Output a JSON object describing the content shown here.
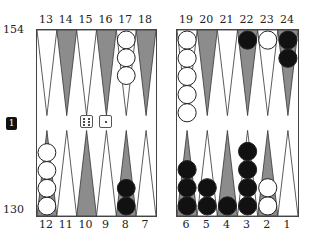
{
  "pip_counts": {
    "top": "154",
    "bottom": "130"
  },
  "cube": {
    "value": "1"
  },
  "dice": [
    6,
    1
  ],
  "point_labels": {
    "top_left": [
      "13",
      "14",
      "15",
      "16",
      "17",
      "18"
    ],
    "top_right": [
      "19",
      "20",
      "21",
      "22",
      "23",
      "24"
    ],
    "bottom_left": [
      "12",
      "11",
      "10",
      "9",
      "8",
      "7"
    ],
    "bottom_right": [
      "6",
      "5",
      "4",
      "3",
      "2",
      "1"
    ]
  },
  "colors": {
    "dark_point": "#8c8c8c",
    "light_point": "#ffffff",
    "black_checker": "#111111",
    "white_checker": "#ffffff",
    "border": "#444444"
  },
  "checkers": {
    "top_left": [
      {
        "point": "13",
        "count": 0,
        "color": ""
      },
      {
        "point": "14",
        "count": 0,
        "color": ""
      },
      {
        "point": "15",
        "count": 0,
        "color": ""
      },
      {
        "point": "16",
        "count": 0,
        "color": ""
      },
      {
        "point": "17",
        "count": 3,
        "color": "white"
      },
      {
        "point": "18",
        "count": 0,
        "color": ""
      }
    ],
    "top_right": [
      {
        "point": "19",
        "count": 5,
        "color": "white"
      },
      {
        "point": "20",
        "count": 0,
        "color": ""
      },
      {
        "point": "21",
        "count": 0,
        "color": ""
      },
      {
        "point": "22",
        "count": 1,
        "color": "black"
      },
      {
        "point": "23",
        "count": 1,
        "color": "white"
      },
      {
        "point": "24",
        "count": 2,
        "color": "black"
      }
    ],
    "bottom_left": [
      {
        "point": "12",
        "count": 4,
        "color": "white"
      },
      {
        "point": "11",
        "count": 0,
        "color": ""
      },
      {
        "point": "10",
        "count": 0,
        "color": ""
      },
      {
        "point": "9",
        "count": 0,
        "color": ""
      },
      {
        "point": "8",
        "count": 2,
        "color": "black"
      },
      {
        "point": "7",
        "count": 0,
        "color": ""
      }
    ],
    "bottom_right": [
      {
        "point": "6",
        "count": 3,
        "color": "black"
      },
      {
        "point": "5",
        "count": 2,
        "color": "black"
      },
      {
        "point": "4",
        "count": 1,
        "color": "black"
      },
      {
        "point": "3",
        "count": 4,
        "color": "black"
      },
      {
        "point": "2",
        "count": 2,
        "color": "white"
      },
      {
        "point": "1",
        "count": 0,
        "color": ""
      }
    ]
  }
}
